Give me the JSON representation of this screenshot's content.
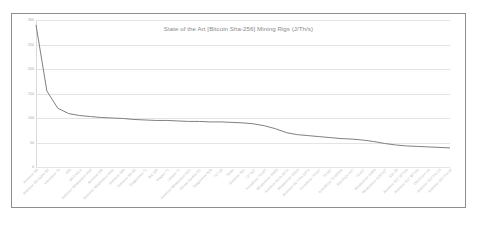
{
  "chart_data": {
    "type": "line",
    "title": "State of the Art [Bitcoin Sha-256] Mining Rigs (J/Th/s)",
    "xlabel": "",
    "ylabel": "",
    "ylim": [
      0,
      300
    ],
    "yticks": [
      0,
      50,
      100,
      150,
      200,
      250,
      300
    ],
    "ytick_labels": [
      "0",
      "50",
      "100",
      "150",
      "200",
      "250",
      "300"
    ],
    "grid": true,
    "legend": "none",
    "line_color": "#808080",
    "categories": [
      "Antminer S9",
      "Antminer S9 Hydro SE",
      "Antminer T9+",
      "E9+",
      "DR3 M3-X",
      "Antminer Whatsminer M10",
      "Antminer S9i",
      "Antminer Whatsminer M3X",
      "Antminer S9k",
      "Antminer S9 SE",
      "Dragonmint T1",
      "Dot 130",
      "Dragon T1",
      "Lithium T1",
      "Antminer Whatsminer M21",
      "Snow Panther B1+",
      "Dragonmint B29",
      "T2T-30",
      "Tardis",
      "Antminer S11",
      "T2T-32T",
      "Innosilicon T3 50T",
      "Whatsminer M20S",
      "Antminer S17e 56TH",
      "Whatsminer M21S",
      "Antminer S17 Pro 53TH",
      "Innosilicon T3 64T",
      "T3 48T",
      "Innosilicon T3 400Mh",
      "Ebit E12+ 44T",
      "T3 46T",
      "Whatsminer M30S",
      "Whatsminer M20 62T",
      "S15 28",
      "Antminer S17 50TH/s",
      "Antminer S17 90TH/s",
      "Dot E11++ 44",
      "Antminer S17 Pro 53",
      "Antminer S17 Pro 50"
    ],
    "values": [
      290,
      155,
      120,
      109,
      105,
      103,
      101,
      100,
      99,
      97,
      96,
      95,
      95,
      94,
      93,
      93,
      92,
      92,
      91,
      90,
      88,
      84,
      78,
      70,
      66,
      64,
      62,
      60,
      58,
      57,
      55,
      52,
      48,
      45,
      43,
      42,
      41,
      40,
      39
    ]
  }
}
